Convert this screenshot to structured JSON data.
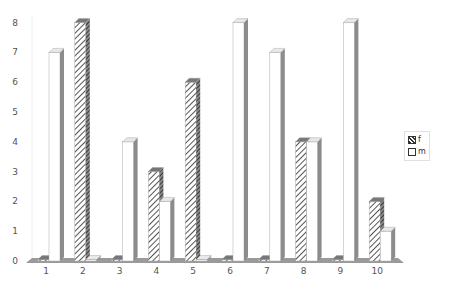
{
  "chart_data": {
    "type": "bar",
    "style": "3d-clustered-column",
    "title": "",
    "xlabel": "",
    "ylabel": "",
    "categories": [
      "1",
      "2",
      "3",
      "4",
      "5",
      "6",
      "7",
      "8",
      "9",
      "10"
    ],
    "series": [
      {
        "name": "f",
        "pattern": "diagonal-hatch",
        "values": [
          0,
          8,
          0,
          3,
          6,
          0,
          0,
          4,
          0,
          2
        ]
      },
      {
        "name": "m",
        "pattern": "white",
        "values": [
          7,
          0,
          4,
          2,
          0,
          8,
          7,
          4,
          8,
          1
        ]
      }
    ],
    "yticks": [
      "0",
      "1",
      "2",
      "3",
      "4",
      "5",
      "6",
      "7",
      "8"
    ],
    "ylim": [
      0,
      8
    ],
    "grid": false,
    "legend_position": "right"
  },
  "legend": {
    "items": [
      {
        "label": "f",
        "icon": "hatched-swatch"
      },
      {
        "label": "m",
        "icon": "white-swatch"
      }
    ]
  },
  "colors": {
    "floor": "#9a9a9a",
    "bar_side": "#8c8c8c",
    "bar_top": "#e8e8e8",
    "hatch": "#555555",
    "axis_text": "#555555"
  }
}
